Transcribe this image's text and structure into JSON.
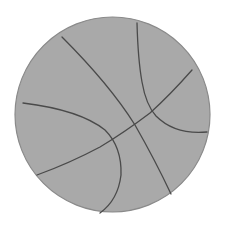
{
  "image": {
    "subject": "basketball",
    "colors": {
      "background": "#ffffff",
      "ball_fill": "#a9a9a9",
      "outline": "#8a8a8a",
      "seam": "#4a4a4a"
    }
  },
  "ball": {
    "cx": 112.5,
    "cy": 114.5,
    "r": 97.5
  },
  "seams": [
    {
      "name": "seam-diagonal-long",
      "d": "M 62 37 Q 110 85 135 125 Q 155 160 171 194"
    },
    {
      "name": "seam-top-right-arc",
      "d": "M 137 23 Q 138 60 142 82 Q 146 105 156 116 Q 175 135 207 132"
    },
    {
      "name": "seam-cross-diagonal",
      "d": "M 192 70 Q 170 95 150 113 Q 125 132 100 147 Q 70 163 37 175"
    },
    {
      "name": "seam-left-arc",
      "d": "M 23 103 Q 80 110 105 130 Q 122 147 121 175 Q 118 200 100 213"
    }
  ]
}
